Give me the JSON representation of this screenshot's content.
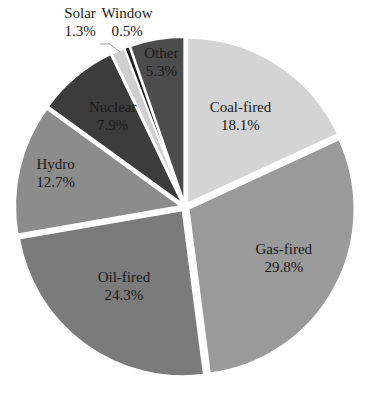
{
  "chart_data": {
    "type": "pie",
    "title": "",
    "categories": [
      "Coal-fired",
      "Gas-fired",
      "Oil-fired",
      "Hydro",
      "Nuclear",
      "Solar",
      "Window",
      "Other"
    ],
    "values": [
      18.1,
      29.8,
      24.3,
      12.7,
      7.9,
      1.3,
      0.5,
      5.3
    ],
    "labels": [
      "18.1%",
      "29.8%",
      "24.3%",
      "12.7%",
      "7.9%",
      "1.3%",
      "0.5%",
      "5.3%"
    ],
    "colors": [
      "#d4d4d4",
      "#9a9a9a",
      "#7b7b7b",
      "#8c8c8c",
      "#3c3c3c",
      "#cfcfcf",
      "#1e1e1e",
      "#4c4c4c"
    ],
    "start_angle": "12 o'clock",
    "direction": "clockwise",
    "exploded": true,
    "legend": "none",
    "external_labels": [
      "Solar",
      "Window"
    ]
  }
}
